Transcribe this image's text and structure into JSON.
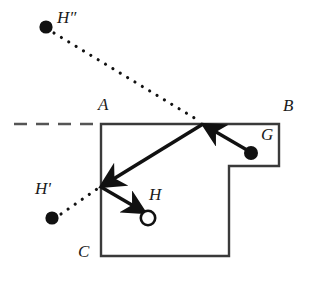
{
  "figure": {
    "type": "geometric-billiard-reflection-diagram",
    "background_color": "#ffffff",
    "stroke_color": "#333333",
    "ink_color": "#111111",
    "dash_color": "#555555",
    "labels": {
      "a": "A",
      "b": "B",
      "c": "C",
      "g": "G",
      "h": "H",
      "h_prime": "H'",
      "h_double_prime": "H″"
    },
    "points": {
      "source_g": {
        "name": "G",
        "x": 251,
        "y": 153,
        "marker": "filled-dot",
        "radius": 7
      },
      "target_h": {
        "name": "H",
        "x": 148,
        "y": 218,
        "marker": "open-circle",
        "radius": 7.5
      },
      "image_h_prime": {
        "name": "H'",
        "x": 52,
        "y": 218,
        "marker": "filled-dot",
        "radius": 6.5
      },
      "image_h_double_prime": {
        "name": "H″",
        "x": 46,
        "y": 27,
        "marker": "filled-dot",
        "radius": 6.5
      },
      "bounce_top": {
        "x": 203,
        "y": 124
      },
      "bounce_left": {
        "x": 101,
        "y": 187
      }
    },
    "label_positions": {
      "a": {
        "x": 99,
        "y": 101
      },
      "b": {
        "x": 284,
        "y": 102
      },
      "c": {
        "x": 79,
        "y": 248
      },
      "g": {
        "x": 261,
        "y": 130
      },
      "h": {
        "x": 150,
        "y": 188
      },
      "h_prime": {
        "x": 36,
        "y": 182
      },
      "h_double_prime": {
        "x": 58,
        "y": 10
      }
    },
    "polygon_outline": "M 101 124 L 279 124 L 279 166 L 229 166 L 229 256 L 101 256 Z",
    "dashed_extension": {
      "x1": 14,
      "y1": 124,
      "x2": 101,
      "y2": 124,
      "dash": "13 9"
    },
    "ray_segments": [
      {
        "name": "incoming-G-to-top-wall",
        "x1": 248,
        "y1": 150,
        "x2": 203,
        "y2": 124,
        "arrow": true
      },
      {
        "name": "reflected-top-to-left-wall",
        "x1": 203,
        "y1": 124,
        "x2": 101,
        "y2": 187,
        "arrow": true
      },
      {
        "name": "reflected-left-wall-to-H",
        "x1": 101,
        "y1": 187,
        "x2": 145,
        "y2": 213,
        "arrow": true
      }
    ],
    "dotted_construction_lines": [
      {
        "name": "H-double-prime-to-top-bounce",
        "x1": 54,
        "y1": 32,
        "x2": 201,
        "y2": 122
      },
      {
        "name": "H-prime-to-left-bounce",
        "x1": 60,
        "y1": 214,
        "x2": 98,
        "y2": 188
      }
    ]
  }
}
